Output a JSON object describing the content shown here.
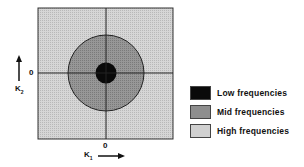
{
  "diagram": {
    "axes": {
      "x_label": "K",
      "x_sub": "1",
      "y_label": "K",
      "y_sub": "2",
      "x_origin_label": "0",
      "y_origin_label": "0"
    },
    "regions": [
      {
        "name": "low",
        "color": "#0a0a0a"
      },
      {
        "name": "mid",
        "color": "#8e8e8e"
      },
      {
        "name": "high",
        "color": "#cfcfcf"
      }
    ]
  },
  "legend": {
    "items": [
      {
        "label": "Low frequencies",
        "color": "#0a0a0a"
      },
      {
        "label": "Mid frequencies",
        "color": "#8e8e8e"
      },
      {
        "label": "High frequencies",
        "color": "#cfcfcf"
      }
    ]
  }
}
